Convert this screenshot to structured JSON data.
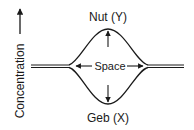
{
  "diagram": {
    "type": "concentration-schematic",
    "axis": {
      "label": "Concentration",
      "direction": "up"
    },
    "top_label": "Nut (Y)",
    "bottom_label": "Geb (X)",
    "center_label": "Space",
    "colors": {
      "line": "#1a1a1a",
      "background": "#ffffff"
    },
    "icons": {
      "axis_arrow": "arrow-up-icon",
      "top_arrow": "arrow-up-icon",
      "bottom_arrow": "arrow-down-icon",
      "space_left_arrow": "arrow-left-icon",
      "space_right_arrow": "arrow-right-icon"
    }
  }
}
